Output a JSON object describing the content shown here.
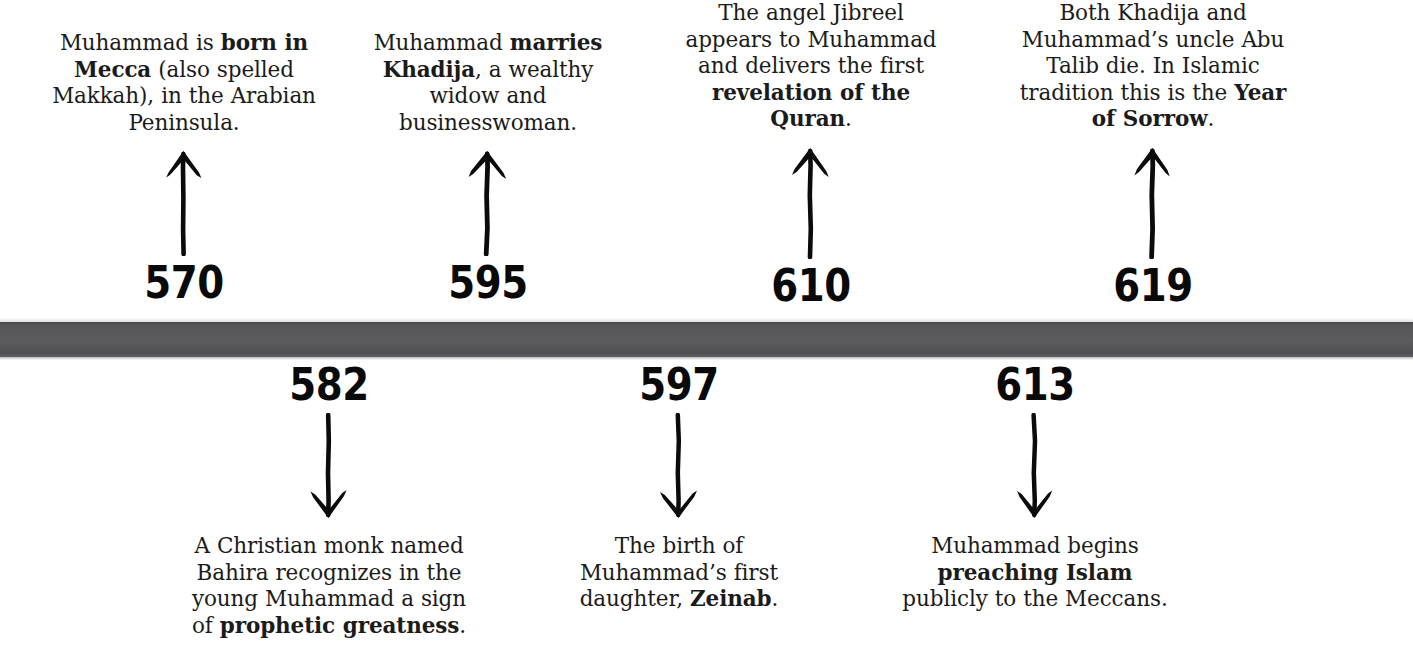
{
  "page": {
    "background_color": "#ffffff",
    "bar_color": "#56565a",
    "text_color": "#1b1b1b",
    "year_color": "#090909"
  },
  "timeline": {
    "bar_name": "timeline-bar",
    "events": [
      {
        "year": "570",
        "position": "above",
        "arrow": "arrow-up-icon",
        "text_segments": [
          {
            "text": "Muhammad is ",
            "bold": false
          },
          {
            "text": "born in Mecca",
            "bold": true
          },
          {
            "text": " (also spelled Makkah), in the Arabian Peninsula.",
            "bold": false
          }
        ],
        "plain_text": "Muhammad is born in Mecca (also spelled Makkah), in the Arabian Peninsula."
      },
      {
        "year": "595",
        "position": "above",
        "arrow": "arrow-up-icon",
        "text_segments": [
          {
            "text": "Muhammad ",
            "bold": false
          },
          {
            "text": "marries Khadija",
            "bold": true
          },
          {
            "text": ", a wealthy widow and businesswoman.",
            "bold": false
          }
        ],
        "plain_text": "Muhammad marries Khadija, a wealthy widow and businesswoman."
      },
      {
        "year": "610",
        "position": "above",
        "arrow": "arrow-up-icon",
        "text_segments": [
          {
            "text": "The angel Jibreel appears to Muhammad and delivers the first ",
            "bold": false
          },
          {
            "text": "revelation of the Quran",
            "bold": true
          },
          {
            "text": ".",
            "bold": false
          }
        ],
        "plain_text": "The angel Jibreel appears to Muhammad and delivers the first revelation of the Quran."
      },
      {
        "year": "619",
        "position": "above",
        "arrow": "arrow-up-icon",
        "text_segments": [
          {
            "text": "Both Khadija and Muhammad’s uncle Abu Talib die. In Islamic tradition this is the ",
            "bold": false
          },
          {
            "text": "Year of Sorrow",
            "bold": true
          },
          {
            "text": ".",
            "bold": false
          }
        ],
        "plain_text": "Both Khadija and Muhammad’s uncle Abu Talib die. In Islamic tradition this is the Year of Sorrow."
      },
      {
        "year": "582",
        "position": "below",
        "arrow": "arrow-down-icon",
        "text_segments": [
          {
            "text": "A Christian monk named Bahira recognizes in the young Muhammad a sign of ",
            "bold": false
          },
          {
            "text": "prophetic greatness",
            "bold": true
          },
          {
            "text": ".",
            "bold": false
          }
        ],
        "plain_text": "A Christian monk named Bahira recognizes in the young Muhammad a sign of prophetic greatness."
      },
      {
        "year": "597",
        "position": "below",
        "arrow": "arrow-down-icon",
        "text_segments": [
          {
            "text": "The birth of Muhammad’s first daughter, ",
            "bold": false
          },
          {
            "text": "Zeinab",
            "bold": true
          },
          {
            "text": ".",
            "bold": false
          }
        ],
        "plain_text": "The birth of Muhammad’s first daughter, Zeinab."
      },
      {
        "year": "613",
        "position": "below",
        "arrow": "arrow-down-icon",
        "text_segments": [
          {
            "text": "Muhammad begins ",
            "bold": false
          },
          {
            "text": "preaching Islam",
            "bold": true
          },
          {
            "text": " publicly to the Meccans.",
            "bold": false
          }
        ],
        "plain_text": "Muhammad begins preaching Islam publicly to the Meccans."
      }
    ]
  }
}
